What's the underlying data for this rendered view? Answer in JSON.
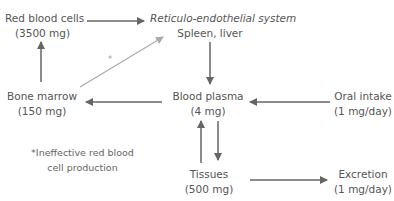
{
  "diagram": {
    "nodes": {
      "red_blood_cells": {
        "label": "Red blood cells",
        "value": "(3500 mg)"
      },
      "res": {
        "label": "Reticulo-endothelial system",
        "sublabel": "Spleen, liver"
      },
      "bone_marrow": {
        "label": "Bone marrow",
        "value": "(150 mg)"
      },
      "blood_plasma": {
        "label": "Blood plasma",
        "value": "(4 mg)"
      },
      "oral_intake": {
        "label": "Oral intake",
        "value": "(1 mg/day)"
      },
      "tissues": {
        "label": "Tissues",
        "value": "(500 mg)"
      },
      "excretion": {
        "label": "Excretion",
        "value": "(1 mg/day)"
      }
    },
    "asterisk": "*",
    "footnote": {
      "line1": "*Ineffective red blood",
      "line2": "cell production"
    },
    "edges": [
      {
        "from": "Red blood cells",
        "to": "Reticulo-endothelial system"
      },
      {
        "from": "Reticulo-endothelial system",
        "to": "Blood plasma"
      },
      {
        "from": "Blood plasma",
        "to": "Bone marrow"
      },
      {
        "from": "Bone marrow",
        "to": "Red blood cells"
      },
      {
        "from": "Bone marrow",
        "to": "Reticulo-endothelial system",
        "note": "*",
        "style": "light"
      },
      {
        "from": "Oral intake",
        "to": "Blood plasma"
      },
      {
        "from": "Blood plasma",
        "to": "Tissues"
      },
      {
        "from": "Tissues",
        "to": "Blood plasma"
      },
      {
        "from": "Tissues",
        "to": "Excretion"
      }
    ],
    "colors": {
      "arrow": "#666666",
      "arrow_light": "#a8a8a8",
      "text": "#555555"
    }
  }
}
